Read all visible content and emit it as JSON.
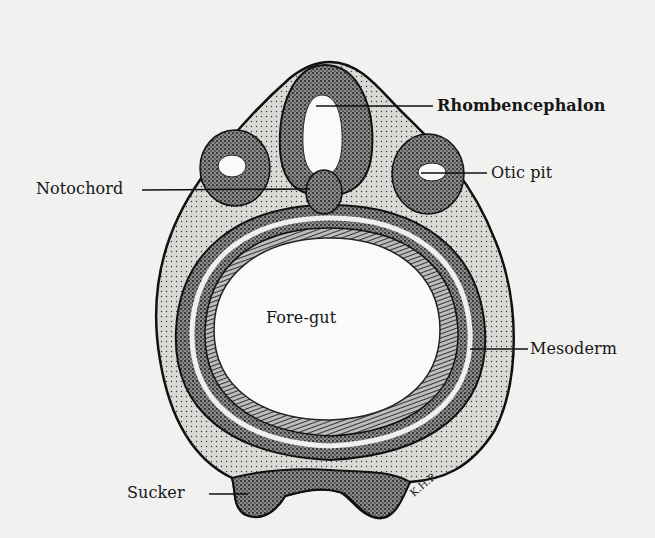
{
  "figure": {
    "signature": "K.H.P.",
    "colors": {
      "background": "#f1f1ef",
      "ink": "#161616",
      "tissue_fill": "#4a4a4a",
      "cavity": "#fafafa"
    }
  },
  "labels": {
    "rhombencephalon": "Rhombencephalon",
    "notochord": "Notochord",
    "otic_pit": "Otic pit",
    "fore_gut": "Fore-gut",
    "mesoderm": "Mesoderm",
    "sucker": "Sucker"
  }
}
